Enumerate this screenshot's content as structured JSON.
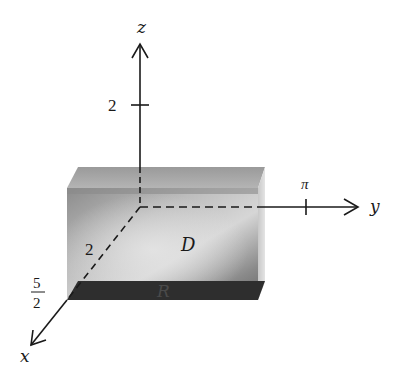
{
  "figure": {
    "type": "3d-coordinate-diagram",
    "axes": {
      "x": {
        "label": "x",
        "tick_label": "5/2",
        "tick_numerator": "5",
        "tick_denominator": "2",
        "inner_label": "2"
      },
      "y": {
        "label": "y",
        "tick_label": "π"
      },
      "z": {
        "label": "z",
        "tick_label": "2"
      }
    },
    "regions": {
      "solid": {
        "label": "D"
      },
      "base": {
        "label": "R"
      }
    },
    "colors": {
      "axis": "#1a1a1a",
      "solid_light": "#d9d9d9",
      "solid_mid": "#9a9a9a",
      "solid_dark": "#6e6e6e",
      "base": "#2e2e2e",
      "background": "#ffffff"
    }
  }
}
